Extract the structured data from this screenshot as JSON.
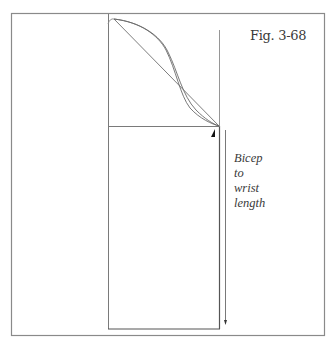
{
  "figure": {
    "label": "Fig. 3-68",
    "measurement_label_lines": [
      "Bicep",
      "to",
      "wrist",
      "length"
    ],
    "colors": {
      "frame": "#7a7a7a",
      "lines": "#6e6e6e",
      "curves": "#6a6a6a",
      "notch": "#111111",
      "text": "#3a3a3a",
      "background": "#ffffff"
    }
  }
}
